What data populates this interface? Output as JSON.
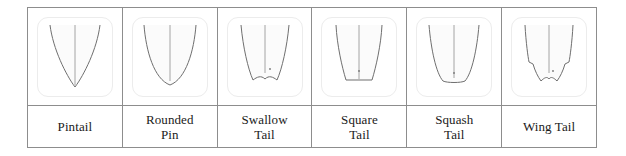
{
  "figure": {
    "caption": "",
    "border_color": "#8d8d8d",
    "thumb_border_color": "#ececec",
    "background_color": "#ffffff",
    "outline_color": "#6f6f6f",
    "fill_color": "#fbfbfb",
    "stringer_color": "#9a9a9a"
  },
  "columns": [
    {
      "id": "pintail",
      "label": "Pintail",
      "shape_name": "pintail-outline",
      "tail_type": "pointed",
      "has_stringer": true,
      "has_fin_dot": false
    },
    {
      "id": "rounded-pin",
      "label": "Rounded\nPin",
      "shape_name": "rounded-pin-outline",
      "tail_type": "rounded",
      "has_stringer": true,
      "has_fin_dot": false
    },
    {
      "id": "swallow-tail",
      "label": "Swallow\nTail",
      "shape_name": "swallow-tail-outline",
      "tail_type": "swallow-notch",
      "has_stringer": true,
      "has_fin_dot": true
    },
    {
      "id": "square-tail",
      "label": "Square\nTail",
      "shape_name": "square-tail-outline",
      "tail_type": "flat-square",
      "has_stringer": true,
      "has_fin_dot": true
    },
    {
      "id": "squash-tail",
      "label": "Squash\nTail",
      "shape_name": "squash-tail-outline",
      "tail_type": "squash-rounded",
      "has_stringer": true,
      "has_fin_dot": true
    },
    {
      "id": "wing-tail",
      "label": "Wing Tail",
      "shape_name": "wing-tail-outline",
      "tail_type": "wing-swallow",
      "has_stringer": true,
      "has_fin_dot": true
    }
  ]
}
